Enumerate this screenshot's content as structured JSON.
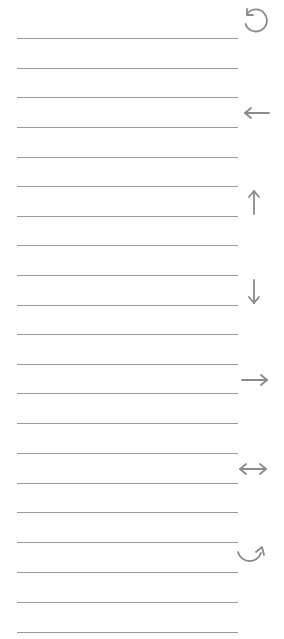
{
  "sheet": {
    "line_color": "#9a9a9a",
    "icon_color": "#8a8a8a",
    "line_count": 21,
    "lines_y": [
      38,
      68,
      97,
      127,
      157,
      186,
      216,
      245,
      275,
      305,
      334,
      364,
      393,
      423,
      453,
      483,
      512,
      542,
      572,
      602,
      632
    ]
  },
  "icons": [
    {
      "name": "rotate-counterclockwise-icon",
      "center_y": 20
    },
    {
      "name": "arrow-left-icon",
      "center_y": 113
    },
    {
      "name": "arrow-up-icon",
      "center_y": 203
    },
    {
      "name": "arrow-down-icon",
      "center_y": 291
    },
    {
      "name": "arrow-right-icon",
      "center_y": 380
    },
    {
      "name": "arrow-left-right-icon",
      "center_y": 469
    },
    {
      "name": "rotate-clockwise-curve-icon",
      "center_y": 557
    }
  ]
}
